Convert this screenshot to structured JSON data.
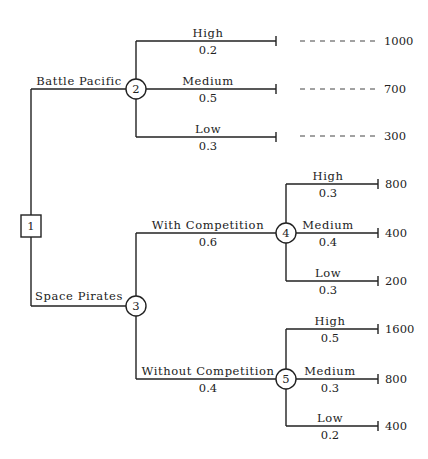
{
  "diagram": {
    "type": "decision-tree",
    "root": {
      "id": "1",
      "shape": "square"
    },
    "decisions": [
      {
        "label": "Battle Pacific",
        "chance_node": "2"
      },
      {
        "label": "Space Pirates",
        "chance_node": "3"
      }
    ],
    "node2": {
      "id": "2",
      "branches": [
        {
          "label": "High",
          "prob": "0.2",
          "payoff": "1000"
        },
        {
          "label": "Medium",
          "prob": "0.5",
          "payoff": "700"
        },
        {
          "label": "Low",
          "prob": "0.3",
          "payoff": "300"
        }
      ]
    },
    "node3": {
      "id": "3",
      "branches": [
        {
          "label": "With Competition",
          "prob": "0.6",
          "chance_node": "4"
        },
        {
          "label": "Without Competition",
          "prob": "0.4",
          "chance_node": "5"
        }
      ]
    },
    "node4": {
      "id": "4",
      "branches": [
        {
          "label": "High",
          "prob": "0.3",
          "payoff": "800"
        },
        {
          "label": "Medium",
          "prob": "0.4",
          "payoff": "400"
        },
        {
          "label": "Low",
          "prob": "0.3",
          "payoff": "200"
        }
      ]
    },
    "node5": {
      "id": "5",
      "branches": [
        {
          "label": "High",
          "prob": "0.5",
          "payoff": "1600"
        },
        {
          "label": "Medium",
          "prob": "0.3",
          "payoff": "800"
        },
        {
          "label": "Low",
          "prob": "0.2",
          "payoff": "400"
        }
      ]
    }
  }
}
